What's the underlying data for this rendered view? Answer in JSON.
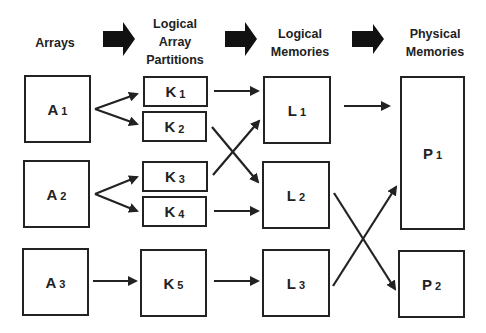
{
  "headers": {
    "arrays": "Arrays",
    "logical_partitions": [
      "Logical",
      "Array",
      "Partitions"
    ],
    "logical_memories": [
      "Logical",
      "Memories"
    ],
    "physical_memories": [
      "Physical",
      "Memories"
    ]
  },
  "arrays": [
    {
      "letter": "A",
      "sub": "1"
    },
    {
      "letter": "A",
      "sub": "2"
    },
    {
      "letter": "A",
      "sub": "3"
    }
  ],
  "partitions": [
    {
      "letter": "K",
      "sub": "1"
    },
    {
      "letter": "K",
      "sub": "2"
    },
    {
      "letter": "K",
      "sub": "3"
    },
    {
      "letter": "K",
      "sub": "4"
    },
    {
      "letter": "K",
      "sub": "5"
    }
  ],
  "logical_memories": [
    {
      "letter": "L",
      "sub": "1"
    },
    {
      "letter": "L",
      "sub": "2"
    },
    {
      "letter": "L",
      "sub": "3"
    }
  ],
  "physical_memories": [
    {
      "letter": "P",
      "sub": "1"
    },
    {
      "letter": "P",
      "sub": "2"
    }
  ],
  "connections": [
    [
      "A1",
      "K1"
    ],
    [
      "A1",
      "K2"
    ],
    [
      "A2",
      "K3"
    ],
    [
      "A2",
      "K4"
    ],
    [
      "A3",
      "K5"
    ],
    [
      "K1",
      "L1"
    ],
    [
      "K2",
      "L2"
    ],
    [
      "K3",
      "L1"
    ],
    [
      "K4",
      "L2"
    ],
    [
      "K5",
      "L3"
    ],
    [
      "L1",
      "P1"
    ],
    [
      "L2",
      "P2"
    ],
    [
      "L3",
      "P1"
    ]
  ],
  "colors": {
    "stroke": "#222222",
    "background": "#ffffff"
  }
}
